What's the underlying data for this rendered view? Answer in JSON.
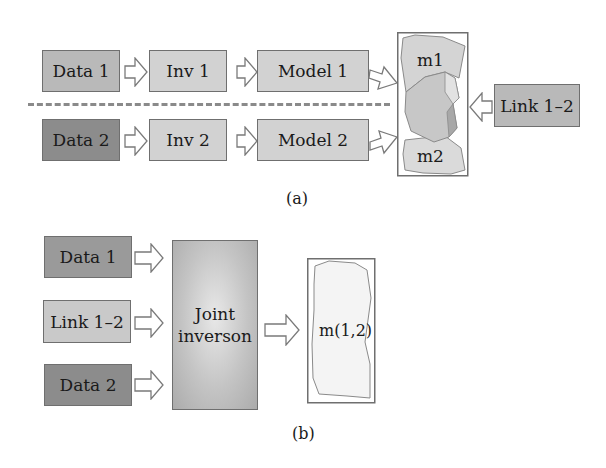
{
  "diagram": {
    "part_a": {
      "caption": "(a)",
      "row1": {
        "data": "Data 1",
        "inv": "Inv 1",
        "model": "Model 1"
      },
      "row2": {
        "data": "Data 2",
        "inv": "Inv 2",
        "model": "Model 2"
      },
      "combined_models": {
        "top_label": "m1",
        "bottom_label": "m2"
      },
      "link": "Link 1–2"
    },
    "part_b": {
      "caption": "(b)",
      "inputs": [
        "Data 1",
        "Link 1–2",
        "Data 2"
      ],
      "joint": {
        "line1": "Joint",
        "line2": "inverson"
      },
      "result": "m(1,2)"
    },
    "colors": {
      "data1": "#9a9a9a",
      "data2": "#8c8c8c",
      "inv_model": "#d2d2d2",
      "link": "#b9b9b9",
      "border": "#6f6f6f",
      "dashed_divider": "#8a8a8a"
    }
  }
}
